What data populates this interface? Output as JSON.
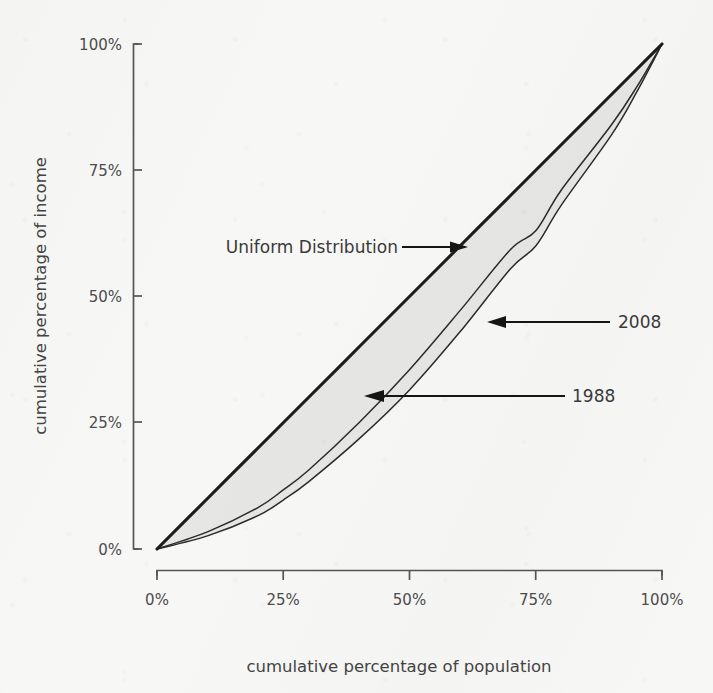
{
  "chart_data": {
    "type": "line",
    "title": "",
    "xlabel": "cumulative percentage of population",
    "ylabel": "cumulative percentage of income",
    "xlim": [
      0,
      100
    ],
    "ylim": [
      0,
      100
    ],
    "grid": false,
    "legend_position": "inline-annotations",
    "x_ticks": [
      "0%",
      "25%",
      "50%",
      "75%",
      "100%"
    ],
    "y_ticks": [
      "0%",
      "25%",
      "50%",
      "75%",
      "100%"
    ],
    "x_tick_values": [
      0,
      25,
      50,
      75,
      100
    ],
    "y_tick_values": [
      0,
      25,
      50,
      75,
      100
    ],
    "x": [
      0,
      10,
      20,
      25,
      30,
      40,
      50,
      60,
      70,
      75,
      80,
      90,
      95,
      100
    ],
    "series": [
      {
        "name": "Uniform Distribution",
        "style": "thick-black-diagonal",
        "values": [
          0,
          10,
          20,
          25,
          30,
          40,
          50,
          60,
          70,
          75,
          80,
          90,
          95,
          100
        ]
      },
      {
        "name": "2008",
        "style": "thin-black-curve",
        "values": [
          0,
          3.4,
          8.2,
          11.7,
          15.6,
          25.0,
          35.5,
          47.2,
          59.3,
          63.0,
          71.0,
          84.0,
          91.5,
          100
        ]
      },
      {
        "name": "1988",
        "style": "thin-black-curve",
        "values": [
          0,
          2.6,
          6.6,
          9.7,
          13.3,
          21.8,
          31.5,
          43.0,
          55.5,
          60.0,
          68.0,
          82.0,
          90.5,
          100
        ]
      }
    ],
    "annotations": [
      {
        "id": "uniform-distribution",
        "label": "Uniform Distribution",
        "arrow": "right",
        "points_to_series": "Uniform Distribution"
      },
      {
        "id": "year-2008",
        "label": "2008",
        "arrow": "left",
        "points_to_series": "2008"
      },
      {
        "id": "year-1988",
        "label": "1988",
        "arrow": "left",
        "points_to_series": "1988"
      }
    ],
    "colors": {
      "background": "#f7f7f6",
      "band_fill": "#e3e3e1",
      "diagonal": "#1c1c1c",
      "curve": "#2b2b2b",
      "axis": "#555555",
      "tick_text": "#4d4d4d",
      "annotation_text": "#3a3a3a"
    }
  }
}
